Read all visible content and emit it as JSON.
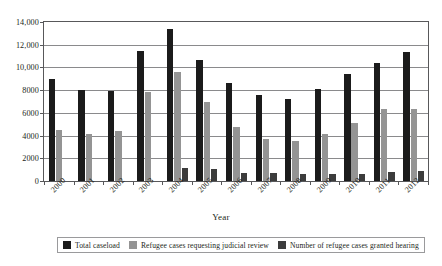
{
  "chart_data": {
    "type": "bar",
    "title": "",
    "xlabel": "Year",
    "ylabel": "",
    "grid": true,
    "legend_position": "bottom",
    "ylim": [
      0,
      14000
    ],
    "yticks": [
      0,
      2000,
      4000,
      6000,
      8000,
      10000,
      12000,
      14000
    ],
    "ytick_labels": [
      "0",
      "2000",
      "4000",
      "6000",
      "8000",
      "10,000",
      "12,000",
      "14,000"
    ],
    "categories": [
      "2000",
      "2001",
      "2002",
      "2003",
      "2004",
      "2005",
      "2006",
      "2007",
      "2008",
      "2009",
      "2010",
      "2011",
      "2012"
    ],
    "series": [
      {
        "name": "Total caseload",
        "color": "#1b1b1b",
        "values": [
          9000,
          8050,
          7950,
          11450,
          13350,
          10650,
          8650,
          7600,
          7200,
          8100,
          9400,
          10350,
          11400
        ]
      },
      {
        "name": "Refugee cases requesting judicial review",
        "color": "#949494",
        "values": [
          4450,
          4150,
          4400,
          7850,
          9600,
          6950,
          4800,
          3700,
          3550,
          4150,
          5100,
          6300,
          6350
        ]
      },
      {
        "name": "Number of refugee cases granted hearing",
        "color": "#3c3c3c",
        "values": [
          0,
          0,
          0,
          0,
          1150,
          1050,
          700,
          700,
          600,
          600,
          650,
          800,
          900
        ]
      }
    ]
  },
  "axis": {
    "x_title": "Year"
  },
  "legend": {
    "items": [
      {
        "label": "Total caseload",
        "color": "#1b1b1b"
      },
      {
        "label": "Refugee cases requesting judicial review",
        "color": "#949494"
      },
      {
        "label": "Number of refugee cases granted hearing",
        "color": "#3c3c3c"
      }
    ]
  }
}
